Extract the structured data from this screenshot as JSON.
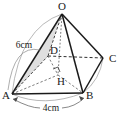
{
  "figure": {
    "kind": "geometry-diagram",
    "background_color": "#ffffff",
    "ink_color": "#1a1a1a",
    "hidden_edge_color": "#3a3a3a",
    "shade_fill": "#d9d9d9",
    "arc_color": "#8a8a8a"
  },
  "vertices": [
    {
      "id": "O",
      "label": "O",
      "x": 62,
      "y": 14,
      "label_x": 62,
      "label_y": 10
    },
    {
      "id": "C",
      "label": "C",
      "x": 103,
      "y": 58,
      "label_x": 110,
      "label_y": 61
    },
    {
      "id": "D",
      "label": "D",
      "x": 48,
      "y": 56,
      "label_x": 50,
      "label_y": 54
    },
    {
      "id": "H",
      "label": "H",
      "x": 58,
      "y": 75,
      "label_x": 59,
      "label_y": 83
    },
    {
      "id": "A",
      "label": "A",
      "x": 12,
      "y": 94,
      "label_x": 6,
      "label_y": 98
    },
    {
      "id": "B",
      "label": "B",
      "x": 83,
      "y": 93,
      "label_x": 88,
      "label_y": 98
    }
  ],
  "dimensions": [
    {
      "id": "OA",
      "label": "6cm",
      "label_x": 24,
      "label_y": 46
    },
    {
      "id": "AB",
      "label": "4cm",
      "label_x": 47,
      "label_y": 110
    }
  ],
  "edges": [
    {
      "id": "OA",
      "from": "O",
      "to": "A",
      "style": "solid"
    },
    {
      "id": "OB",
      "from": "O",
      "to": "B",
      "style": "solid"
    },
    {
      "id": "OC",
      "from": "O",
      "to": "C",
      "style": "solid"
    },
    {
      "id": "OD",
      "from": "O",
      "to": "D",
      "style": "dashed"
    },
    {
      "id": "OH",
      "from": "O",
      "to": "H",
      "style": "dotted"
    },
    {
      "id": "AB",
      "from": "A",
      "to": "B",
      "style": "solid"
    },
    {
      "id": "BC",
      "from": "B",
      "to": "C",
      "style": "solid"
    },
    {
      "id": "AD",
      "from": "A",
      "to": "D",
      "style": "dashed"
    },
    {
      "id": "DC",
      "from": "D",
      "to": "C",
      "style": "dashed"
    },
    {
      "id": "AH",
      "from": "A",
      "to": "H",
      "style": "dashed"
    },
    {
      "id": "HB",
      "from": "H",
      "to": "B",
      "style": "dashed"
    },
    {
      "id": "DH",
      "from": "D",
      "to": "H",
      "style": "dashed"
    }
  ],
  "markers": {
    "right_angle_at": "H",
    "shaded_face": "O-A-D"
  }
}
